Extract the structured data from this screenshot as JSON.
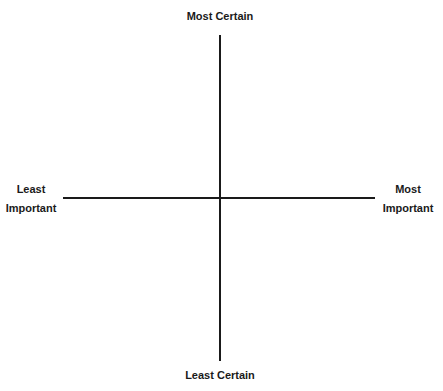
{
  "diagram": {
    "type": "quadrant-axes",
    "vertical_axis": {
      "top_label": "Most Certain",
      "bottom_label": "Least Certain"
    },
    "horizontal_axis": {
      "left_label": [
        "Least",
        "Important"
      ],
      "right_label": [
        "Most",
        "Important"
      ]
    },
    "line_color": "#1a1a1a",
    "text_color": "#1a1a1a"
  }
}
